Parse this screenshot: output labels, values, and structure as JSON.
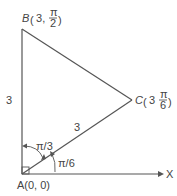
{
  "diagram": {
    "points": {
      "A": {
        "label": "A(0, 0)",
        "name": "A",
        "coords": "(0, 0)"
      },
      "B": {
        "label": "B",
        "r": "3",
        "theta_num": "π",
        "theta_den": "2"
      },
      "C": {
        "label": "C",
        "r": "3",
        "theta_num": "π",
        "theta_den": "6"
      }
    },
    "sides": {
      "AB": "3",
      "AC": "3"
    },
    "angles": {
      "BAC": "π/3",
      "CAX": "π/6"
    },
    "axis": {
      "x_label": "X"
    },
    "colors": {
      "line": "#555555",
      "text": "#444444"
    }
  }
}
